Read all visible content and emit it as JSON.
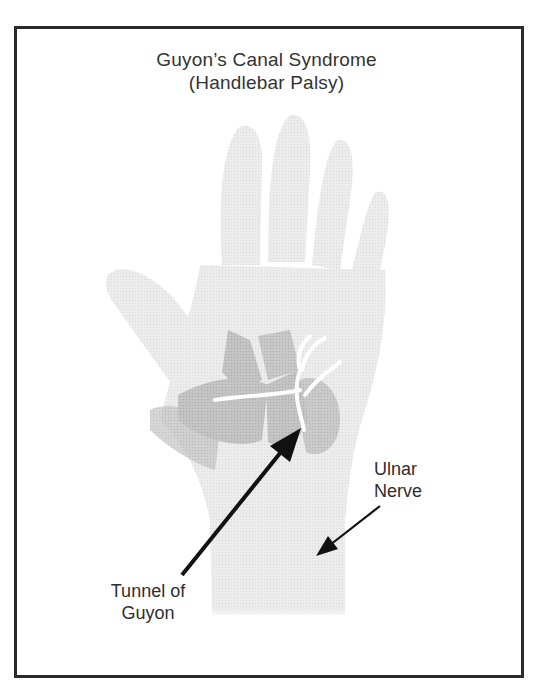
{
  "figure": {
    "title_line1": "Guyon’s Canal Syndrome",
    "title_line2": "(Handlebar Palsy)"
  },
  "labels": {
    "ulnar_nerve": {
      "line1": "Ulnar",
      "line2": "Nerve"
    },
    "tunnel_of_guyon": {
      "line1": "Tunnel of",
      "line2": "Guyon"
    }
  },
  "colors": {
    "frame_border": "#2b2b2b",
    "skin": "#e9e9e9",
    "muscle": "#bdbdbd",
    "nerve": "#ffffff",
    "arrow": "#111111"
  }
}
